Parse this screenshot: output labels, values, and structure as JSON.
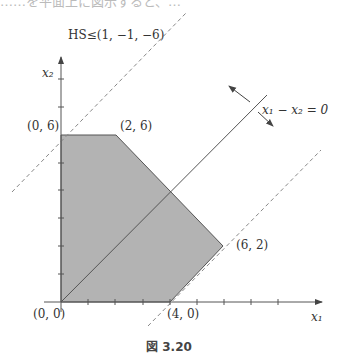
{
  "top_cut_text": "……を平面上に図示すると、…",
  "figure": {
    "caption": "図 3.20",
    "halfspace_label": "HS≤(1, −1, −6)",
    "line_label": "x₁ − x₂ = 0",
    "axis_x_label": "x₁",
    "axis_y_label": "x₂",
    "vertices": [
      {
        "label": "(0, 0)",
        "x": 0,
        "y": 0
      },
      {
        "label": "(0, 6)",
        "x": 0,
        "y": 6
      },
      {
        "label": "(2, 6)",
        "x": 2,
        "y": 6
      },
      {
        "label": "(6, 2)",
        "x": 6,
        "y": 2
      },
      {
        "label": "(4, 0)",
        "x": 4,
        "y": 0
      }
    ],
    "lines": [
      {
        "equation": "x1 - x2 = 0",
        "style": "solid"
      },
      {
        "equation": "x1 - x2 = -6",
        "style": "dashed"
      },
      {
        "equation": "x1 - x2 = 4",
        "style": "dashed"
      }
    ],
    "colors": {
      "region_fill": "#b3b3b3",
      "line": "#555555",
      "text": "#333333"
    }
  }
}
